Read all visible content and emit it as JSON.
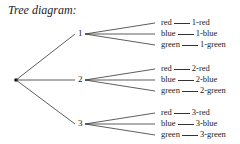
{
  "title": "Tree diagram:",
  "tree": {
    "root": {
      "x": 16,
      "y": 80
    },
    "nodes": [
      {
        "label": "1",
        "x": 81,
        "y": 34,
        "leaves": [
          {
            "branch": "red",
            "outcome": "1-red",
            "y": 23
          },
          {
            "branch": "blue",
            "outcome": "1-blue",
            "y": 34
          },
          {
            "branch": "green",
            "outcome": "1-green",
            "y": 45
          }
        ]
      },
      {
        "label": "2",
        "x": 81,
        "y": 80,
        "leaves": [
          {
            "branch": "red",
            "outcome": "2-red",
            "y": 69
          },
          {
            "branch": "blue",
            "outcome": "2-blue",
            "y": 80
          },
          {
            "branch": "green",
            "outcome": "2-green",
            "y": 91
          }
        ]
      },
      {
        "label": "3",
        "x": 81,
        "y": 124,
        "leaves": [
          {
            "branch": "red",
            "outcome": "3-red",
            "y": 113
          },
          {
            "branch": "blue",
            "outcome": "3-blue",
            "y": 124
          },
          {
            "branch": "green",
            "outcome": "3-green",
            "y": 135
          }
        ]
      }
    ]
  }
}
